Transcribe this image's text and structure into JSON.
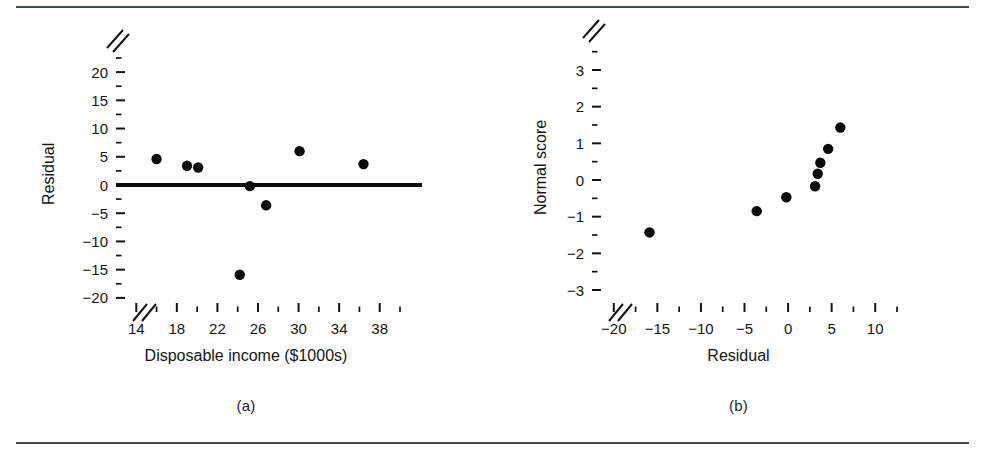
{
  "figure": {
    "panel_a_caption": "(a)",
    "panel_b_caption": "(b)"
  },
  "chart_data": [
    {
      "type": "scatter",
      "panel": "(a)",
      "title": "",
      "xlabel": "Disposable income ($1000s)",
      "ylabel": "Residual",
      "xlim": [
        12,
        40
      ],
      "ylim": [
        -22.5,
        22.5
      ],
      "grid": false,
      "legend": "none",
      "x_tick_labels": [
        "14",
        "18",
        "22",
        "26",
        "30",
        "34",
        "38"
      ],
      "x_tick_values": [
        14,
        18,
        22,
        26,
        30,
        34,
        38
      ],
      "x_minor_tick_values": [
        12,
        16,
        20,
        24,
        28,
        32,
        36,
        40
      ],
      "y_tick_labels": [
        "20",
        "15",
        "10",
        "5",
        "0",
        "−5",
        "−10",
        "−15",
        "−20"
      ],
      "y_tick_values": [
        20,
        15,
        10,
        5,
        0,
        -5,
        -10,
        -15,
        -20
      ],
      "axis_break_x": true,
      "axis_break_y": true,
      "reference_line": {
        "orientation": "horizontal",
        "y": 0
      },
      "points": [
        {
          "x": 16.0,
          "y": 4.6
        },
        {
          "x": 19.0,
          "y": 3.4
        },
        {
          "x": 20.1,
          "y": 3.1
        },
        {
          "x": 24.2,
          "y": -15.9
        },
        {
          "x": 25.2,
          "y": -0.2
        },
        {
          "x": 26.8,
          "y": -3.6
        },
        {
          "x": 30.1,
          "y": 6.0
        },
        {
          "x": 36.4,
          "y": 3.7
        }
      ]
    },
    {
      "type": "scatter",
      "panel": "(b)",
      "title": "",
      "xlabel": "Residual",
      "ylabel": "Normal score",
      "xlim": [
        -22.5,
        12.5
      ],
      "ylim": [
        -3.6,
        3.6
      ],
      "grid": false,
      "legend": "none",
      "x_tick_labels": [
        "−20",
        "−15",
        "−10",
        "−5",
        "0",
        "5",
        "10"
      ],
      "x_tick_values": [
        -20,
        -15,
        -10,
        -5,
        0,
        5,
        10
      ],
      "y_tick_labels": [
        "3",
        "2",
        "1",
        "0",
        "−1",
        "−2",
        "−3"
      ],
      "y_tick_values": [
        3,
        2,
        1,
        0,
        -1,
        -2,
        -3
      ],
      "y_minor_tick_values": [
        3.5,
        2.5,
        1.5,
        0.5,
        -0.5,
        -1.5,
        -2.5
      ],
      "axis_break_x": true,
      "axis_break_y": true,
      "points": [
        {
          "x": -15.9,
          "y": -1.43
        },
        {
          "x": -3.6,
          "y": -0.85
        },
        {
          "x": -0.2,
          "y": -0.47
        },
        {
          "x": 3.1,
          "y": -0.17
        },
        {
          "x": 3.4,
          "y": 0.17
        },
        {
          "x": 3.7,
          "y": 0.47
        },
        {
          "x": 4.6,
          "y": 0.85
        },
        {
          "x": 6.0,
          "y": 1.43
        }
      ]
    }
  ]
}
